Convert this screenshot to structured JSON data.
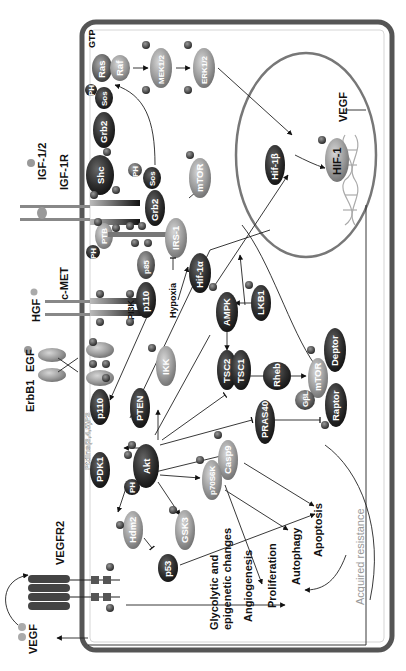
{
  "diagram": {
    "orientation": "rotated 90 degrees counter-clockwise",
    "colors": {
      "membrane": "#555555",
      "nucleus": "#777777",
      "dark_node": "#2b2b2b",
      "light_node": "#9a9a9a",
      "phospho": "#3a3a3a",
      "resistance_text": "#999999"
    },
    "extracellular": {
      "ligands": [
        "IGF-1/2",
        "HGF",
        "EGF",
        "VEGF"
      ],
      "receptors": [
        "IGF-1R",
        "c-MET",
        "ErbB1",
        "VEGFR2"
      ],
      "other_labels": [
        "GTP"
      ]
    },
    "nodes": {
      "ras": "Ras",
      "raf": "Raf",
      "sos1": "Sos",
      "ph1": "PH",
      "grb2_1": "Grb2",
      "mek": "MEK1/2",
      "erk": "ERK1/2",
      "shc": "Shc",
      "ph2": "PH",
      "sos2": "Sos",
      "grb2_2": "Grb2",
      "ph3": "PH",
      "ptb": "PTB",
      "irs1": "IRS-1",
      "mtor1": "mTOR",
      "pi3k": "PI3K",
      "p110_a": "p110",
      "p85": "p85",
      "hypoxia": "Hypoxia",
      "hif1a": "Hif-1α",
      "ampk": "AMPK",
      "lkb1": "LKB1",
      "ikk": "IKK",
      "pten": "PTEN",
      "p110_b": "p110",
      "pip3": "PtdIns(3,4,5)P3",
      "pdk1": "PDK1",
      "ph4": "PH",
      "akt": "Akt",
      "tsc2": "TSC2",
      "tsc1": "TSC1",
      "rheb": "Rheb",
      "mtor2": "mTOR",
      "deptor": "Deptor",
      "gbl": "GβL",
      "raptor": "Raptor",
      "pras40": "PRAS40",
      "casp9": "Casp9",
      "p70s6k": "p70S6K",
      "gsk3": "GSK3",
      "hdm2": "Hdm2",
      "p53": "p53",
      "hif1b": "Hif-1β",
      "hif1": "HIF-1",
      "vegf_gene": "VEGF",
      "phospho": "P"
    },
    "outcomes": {
      "glycolytic_1": "Glycolytic and",
      "glycolytic_2": "epigenetic changes",
      "angiogenesis": "Angiogenesis",
      "proliferation": "Proliferation",
      "autophagy": "Autophagy",
      "apoptosis": "Apoptosis",
      "resistance": "Acquired resistance"
    }
  }
}
